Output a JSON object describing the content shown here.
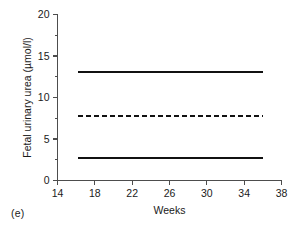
{
  "figure": {
    "panel_label": "(e)"
  },
  "chart_data": {
    "type": "line",
    "title": "",
    "xlabel": "Weeks",
    "ylabel": "Fetal urinary urea (µmol/l)",
    "xlim": [
      14,
      38
    ],
    "ylim": [
      0,
      20
    ],
    "x_ticks": [
      14,
      18,
      22,
      26,
      30,
      34,
      38
    ],
    "x_tick_labels": [
      "14",
      "18",
      "22",
      "26",
      "30",
      "34",
      "38"
    ],
    "x_minor_ticks": [
      16,
      20,
      24,
      28,
      32,
      36
    ],
    "y_ticks": [
      0,
      5,
      10,
      15,
      20
    ],
    "y_tick_labels": [
      "0",
      "5",
      "10",
      "15",
      "20"
    ],
    "y_minor_ticks": [
      2.5,
      7.5,
      12.5,
      17.5
    ],
    "grid": false,
    "legend": false,
    "x_range_data": [
      16.2,
      36.0
    ],
    "series": [
      {
        "name": "upper reference limit",
        "style": "solid",
        "x": [
          16.2,
          36.0
        ],
        "values": [
          13.1,
          13.1
        ]
      },
      {
        "name": "mean",
        "style": "dashed",
        "x": [
          16.2,
          36.0
        ],
        "values": [
          7.8,
          7.8
        ]
      },
      {
        "name": "lower reference limit",
        "style": "solid",
        "x": [
          16.2,
          36.0
        ],
        "values": [
          2.7,
          2.7
        ]
      }
    ]
  }
}
